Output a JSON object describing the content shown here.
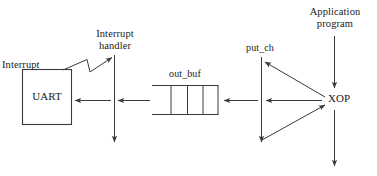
{
  "diagram": {
    "background_color": "#ffffff",
    "stroke_color": "#3a3a3a",
    "text_color": "#1a1a1a",
    "nodes": {
      "uart": {
        "label": "UART",
        "shape": "rectangle"
      },
      "interrupt": {
        "label": "Interrupt",
        "shape": "text"
      },
      "interrupt_handler": {
        "label": "Interrupt\nhandler",
        "shape": "text-with-vertical-line"
      },
      "out_buf": {
        "label": "out_buf",
        "shape": "open-ended-buffer",
        "cells": 3
      },
      "put_ch": {
        "label": "put_ch",
        "shape": "text-with-vertical-line"
      },
      "xop": {
        "label": "XOP",
        "shape": "text"
      },
      "application_program": {
        "label": "Application\nprogram",
        "shape": "text-with-vertical-line"
      }
    },
    "edges": [
      {
        "from": "uart",
        "to": "interrupt_handler",
        "style": "zigzag-arrow"
      },
      {
        "from": "interrupt_handler",
        "to": "uart",
        "style": "arrow-left"
      },
      {
        "from": "out_buf",
        "to": "interrupt_handler",
        "style": "arrow-left"
      },
      {
        "from": "put_ch",
        "to": "out_buf",
        "style": "arrow-left"
      },
      {
        "from": "xop",
        "to": "put_ch",
        "style": "arrow-left"
      },
      {
        "from": "xop",
        "to": "put_ch",
        "style": "arrow-diagonal-up-left"
      },
      {
        "from": "put_ch",
        "to": "xop",
        "style": "arrow-diagonal-up-right"
      },
      {
        "from": "application_program",
        "to": "xop",
        "style": "arrow-down"
      },
      {
        "from": "xop",
        "to": "below",
        "style": "arrow-down"
      },
      {
        "from": "interrupt_handler",
        "to": "below",
        "style": "arrow-down"
      },
      {
        "from": "put_ch",
        "to": "below",
        "style": "arrow-down"
      }
    ]
  },
  "labels": {
    "uart": "UART",
    "interrupt": "Interrupt",
    "interrupt_handler_line1": "Interrupt",
    "interrupt_handler_line2": "handler",
    "out_buf": "out_buf",
    "put_ch": "put_ch",
    "xop": "XOP",
    "app_line1": "Application",
    "app_line2": "program"
  }
}
